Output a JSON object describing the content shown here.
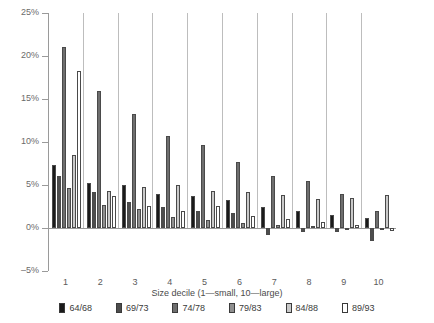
{
  "chart_data": {
    "type": "bar",
    "title": "",
    "xlabel": "Size decile (1—small, 10—large)",
    "ylabel": "",
    "categories": [
      "1",
      "2",
      "3",
      "4",
      "5",
      "6",
      "7",
      "8",
      "9",
      "10"
    ],
    "ylim": [
      -5,
      25
    ],
    "yticks": [
      25,
      20,
      15,
      10,
      5,
      0,
      -5
    ],
    "ytick_labels": [
      "25%",
      "20%",
      "15%",
      "10%",
      "5%",
      "0%",
      "–5%"
    ],
    "grid": false,
    "legend_position": "bottom",
    "series": [
      {
        "name": "64/68",
        "color": "#1a1a1a",
        "values": [
          7.3,
          5.2,
          5.0,
          4.0,
          3.7,
          3.2,
          2.5,
          2.0,
          1.5,
          1.2
        ]
      },
      {
        "name": "69/73",
        "color": "#4d4d4d",
        "values": [
          6.0,
          4.2,
          3.0,
          2.5,
          2.0,
          1.7,
          -0.8,
          -0.5,
          -0.5,
          -1.5
        ]
      },
      {
        "name": "74/78",
        "color": "#6e6e6e",
        "values": [
          21.0,
          15.9,
          13.3,
          10.7,
          9.6,
          7.7,
          6.0,
          5.5,
          4.0,
          2.0
        ]
      },
      {
        "name": "79/83",
        "color": "#8f8f8f",
        "values": [
          4.7,
          2.7,
          2.2,
          1.3,
          0.9,
          0.6,
          0.3,
          0.2,
          0.0,
          -0.2
        ]
      },
      {
        "name": "84/88",
        "color": "#c9c9c9",
        "values": [
          8.5,
          4.3,
          4.8,
          5.0,
          4.3,
          4.2,
          3.8,
          3.4,
          3.5,
          3.8
        ]
      },
      {
        "name": "89/93",
        "color": "#ffffff",
        "values": [
          18.3,
          3.7,
          2.6,
          2.0,
          2.6,
          1.4,
          1.1,
          0.7,
          0.4,
          -0.3
        ]
      }
    ]
  },
  "legend": {
    "items": [
      {
        "label": "64/68"
      },
      {
        "label": "69/73"
      },
      {
        "label": "74/78"
      },
      {
        "label": "79/83"
      },
      {
        "label": "84/88"
      },
      {
        "label": "89/93"
      }
    ]
  }
}
